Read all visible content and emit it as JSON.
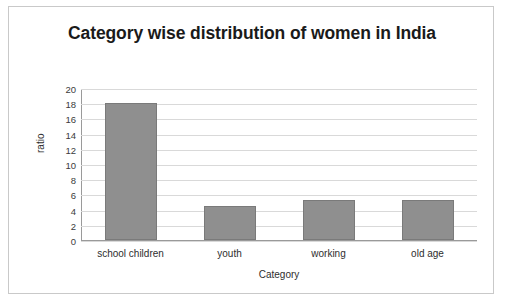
{
  "chart_data": {
    "type": "bar",
    "title": "Category wise distribution of women in India",
    "xlabel": "Category",
    "ylabel": "ratio",
    "categories": [
      "school children",
      "youth",
      "working",
      "old age"
    ],
    "values": [
      18,
      4.5,
      5.2,
      5.3
    ],
    "ylim": [
      0,
      20
    ],
    "yticks": [
      0,
      2,
      4,
      6,
      8,
      10,
      12,
      14,
      16,
      18,
      20
    ],
    "ytick_labels": [
      "0",
      "2",
      "4",
      "6",
      "8",
      "10",
      "12",
      "14",
      "16",
      "18",
      "20"
    ],
    "grid": true,
    "legend": false,
    "bar_color": "#8f8f8f"
  }
}
